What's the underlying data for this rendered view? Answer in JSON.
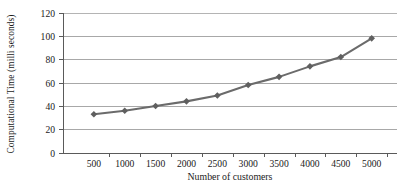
{
  "chart_data": {
    "type": "line",
    "title": "",
    "xlabel": "Number of customers",
    "ylabel": "Computational Time (milli seconds)",
    "categories": [
      500,
      1000,
      1500,
      2000,
      2500,
      3000,
      3500,
      4000,
      4500,
      5000
    ],
    "x_tick_labels": [
      "500",
      "1000",
      "1500",
      "2000",
      "2500",
      "3000",
      "3500",
      "4000",
      "4500",
      "5000"
    ],
    "y_tick_labels": [
      "0",
      "20",
      "40",
      "60",
      "80",
      "100",
      "120"
    ],
    "y_ticks": [
      0,
      20,
      40,
      60,
      80,
      100,
      120
    ],
    "ylim": [
      0,
      120
    ],
    "values": [
      33,
      36,
      40,
      44,
      49,
      58,
      65,
      74,
      82,
      98
    ],
    "series": [
      {
        "name": "Computational Time",
        "values": [
          33,
          36,
          40,
          44,
          49,
          58,
          65,
          74,
          82,
          98
        ],
        "marker": "diamond",
        "color": "#666666"
      }
    ],
    "grid": true,
    "legend": "none",
    "line_color": "#6b6b6b",
    "marker_color": "#5f5f5f",
    "gridline_color": "#a8a8a8",
    "axis_color": "#5a5a5a",
    "background": "#ffffff"
  }
}
